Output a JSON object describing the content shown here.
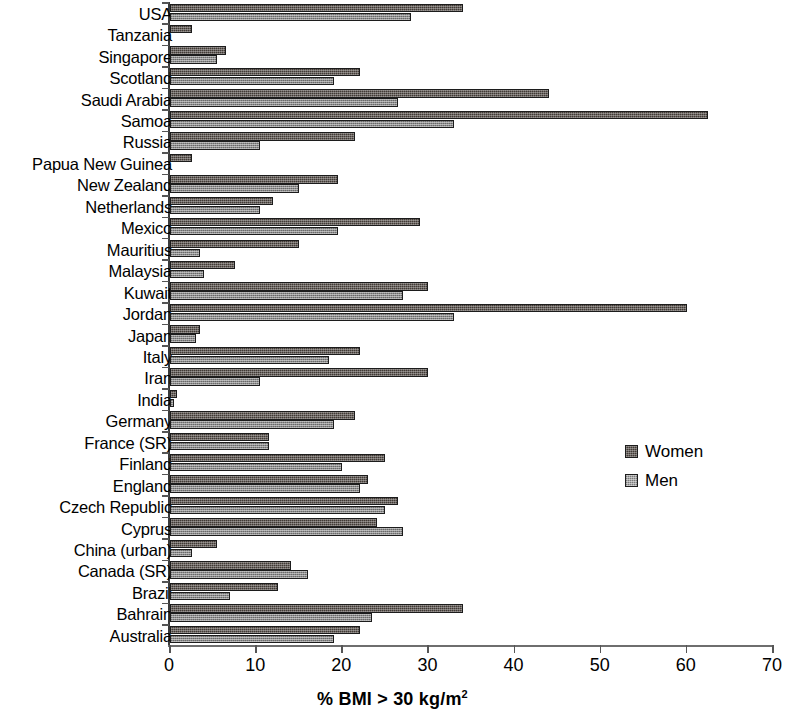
{
  "chart_data": {
    "type": "bar",
    "orientation": "horizontal",
    "title": "",
    "xlabel": "% BMI > 30 kg/m2",
    "xlabel_parts": {
      "main": "% BMI > 30 kg/m",
      "superscript": "2"
    },
    "ylabel": "",
    "xlim": [
      0,
      70
    ],
    "xticks": [
      0,
      10,
      20,
      30,
      40,
      50,
      60,
      70
    ],
    "xtick_labels": [
      "0",
      "10",
      "20",
      "30",
      "40",
      "50",
      "60",
      "70"
    ],
    "grid": false,
    "legend_position": "middle-right",
    "categories": [
      "USA",
      "Tanzania",
      "Singapore",
      "Scotland",
      "Saudi Arabia",
      "Samoa",
      "Russia",
      "Papua New Guinea",
      "New Zealand",
      "Netherlands",
      "Mexico",
      "Mauritius",
      "Malaysia",
      "Kuwait",
      "Jordan",
      "Japan",
      "Italy",
      "Iran",
      "India",
      "Germany",
      "France (SR)",
      "Finland",
      "England",
      "Czech Republic",
      "Cyprus",
      "China (urban)",
      "Canada (SR)",
      "Brazil",
      "Bahrain",
      "Australia"
    ],
    "series": [
      {
        "name": "Women",
        "color": "#413a35",
        "values": [
          34.0,
          2.5,
          6.5,
          22.0,
          44.0,
          62.5,
          21.5,
          2.5,
          19.5,
          12.0,
          29.0,
          15.0,
          7.5,
          30.0,
          60.0,
          3.5,
          22.0,
          30.0,
          0.8,
          21.5,
          11.5,
          25.0,
          23.0,
          26.5,
          24.0,
          5.5,
          14.0,
          12.5,
          34.0,
          22.0
        ]
      },
      {
        "name": "Men",
        "color": "#8c8c8c",
        "values": [
          28.0,
          0.0,
          5.5,
          19.0,
          26.5,
          33.0,
          10.5,
          0.0,
          15.0,
          10.5,
          19.5,
          3.5,
          4.0,
          27.0,
          33.0,
          3.0,
          18.5,
          10.5,
          0.5,
          19.0,
          11.5,
          20.0,
          22.0,
          25.0,
          27.0,
          2.5,
          16.0,
          7.0,
          23.5,
          19.0
        ]
      }
    ]
  },
  "legend": {
    "entries": [
      {
        "label": "Women",
        "swatch": "women"
      },
      {
        "label": "Men",
        "swatch": "men"
      }
    ]
  }
}
